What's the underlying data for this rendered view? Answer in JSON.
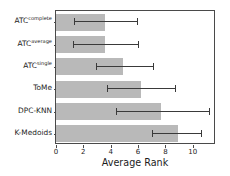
{
  "chart_data": {
    "type": "bar",
    "orientation": "horizontal",
    "title": "",
    "xlabel": "Average Rank",
    "ylabel": "",
    "xlim": [
      0,
      11.7
    ],
    "ylim": null,
    "grid": false,
    "legend": null,
    "xticks": [
      0,
      2,
      4,
      6,
      8,
      10
    ],
    "xticklabels": [
      "0",
      "2",
      "4",
      "6",
      "8",
      "10"
    ],
    "categories": [
      "ATC^complete",
      "ATC^average",
      "ATC^single",
      "ToMe",
      "DPC-KNN",
      "K-Medoids"
    ],
    "category_labels": [
      {
        "base": "ATC",
        "sup": "complete"
      },
      {
        "base": "ATC",
        "sup": "average"
      },
      {
        "base": "ATC",
        "sup": "single"
      },
      {
        "base": "ToMe",
        "sup": ""
      },
      {
        "base": "DPC-KNN",
        "sup": ""
      },
      {
        "base": "K-Medoids",
        "sup": ""
      }
    ],
    "values": [
      3.6,
      3.6,
      4.9,
      6.2,
      7.7,
      8.9
    ],
    "error_low": [
      1.3,
      1.25,
      2.9,
      3.7,
      4.4,
      7.0
    ],
    "error_high": [
      5.9,
      6.0,
      7.1,
      8.7,
      11.2,
      10.6
    ],
    "bar_color": "#b9b9b9",
    "error_color": "#3a3a3a",
    "axis_color": "#4a4a4a",
    "background": "#ffffff"
  }
}
